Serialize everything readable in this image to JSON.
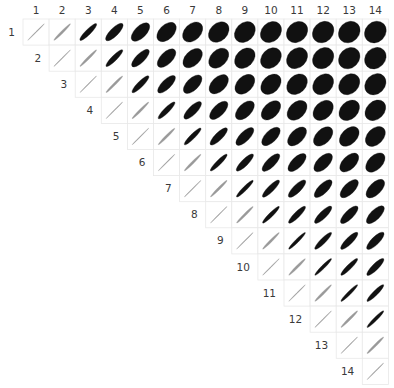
{
  "figure": {
    "title": "",
    "background_color": "#ffffff",
    "ellipse_color": "#111111",
    "faint_ellipse_color": "#9a9a9a",
    "cell_border_color": "#e8e8e8",
    "label_color": "#3a3a3a"
  },
  "axes": {
    "top_labels": [
      "1",
      "2",
      "3",
      "4",
      "5",
      "6",
      "7",
      "8",
      "9",
      "10",
      "11",
      "12",
      "13",
      "14"
    ],
    "diagonal_labels": [
      "1",
      "2",
      "3",
      "4",
      "5",
      "6",
      "7",
      "8",
      "9",
      "10",
      "11",
      "12",
      "13",
      "14"
    ]
  },
  "chart_data": {
    "type": "heatmap",
    "subtype": "correlation-ellipse-matrix",
    "title": "",
    "xlabel": "",
    "ylabel": "",
    "grid": true,
    "legend_position": "none",
    "n_variables": 14,
    "triangle": "upper",
    "diagonal_shown": true,
    "value_range": [
      0,
      1
    ],
    "encoding": "Ellipse eccentricity encodes correlation: a thin 45-degree line is r = 1, a wide round ellipse is r near 0. All ellipses tilt positively (all correlations positive).",
    "categories": [
      "1",
      "2",
      "3",
      "4",
      "5",
      "6",
      "7",
      "8",
      "9",
      "10",
      "11",
      "12",
      "13",
      "14"
    ],
    "matrix": [
      [
        1.0,
        0.99,
        0.95,
        0.88,
        0.75,
        0.62,
        0.52,
        0.45,
        0.4,
        0.36,
        0.33,
        0.3,
        0.28,
        0.26
      ],
      [
        null,
        1.0,
        0.99,
        0.95,
        0.86,
        0.74,
        0.62,
        0.53,
        0.46,
        0.41,
        0.37,
        0.33,
        0.31,
        0.29
      ],
      [
        null,
        null,
        1.0,
        0.99,
        0.94,
        0.85,
        0.74,
        0.64,
        0.56,
        0.49,
        0.44,
        0.4,
        0.37,
        0.34
      ],
      [
        null,
        null,
        null,
        1.0,
        0.99,
        0.95,
        0.87,
        0.78,
        0.69,
        0.62,
        0.55,
        0.5,
        0.46,
        0.43
      ],
      [
        null,
        null,
        null,
        null,
        1.0,
        0.99,
        0.96,
        0.9,
        0.83,
        0.76,
        0.69,
        0.63,
        0.58,
        0.54
      ],
      [
        null,
        null,
        null,
        null,
        null,
        1.0,
        0.99,
        0.96,
        0.92,
        0.86,
        0.8,
        0.74,
        0.69,
        0.64
      ],
      [
        null,
        null,
        null,
        null,
        null,
        null,
        1.0,
        0.99,
        0.97,
        0.93,
        0.89,
        0.84,
        0.79,
        0.74
      ],
      [
        null,
        null,
        null,
        null,
        null,
        null,
        null,
        1.0,
        0.99,
        0.97,
        0.94,
        0.91,
        0.87,
        0.83
      ],
      [
        null,
        null,
        null,
        null,
        null,
        null,
        null,
        null,
        1.0,
        0.99,
        0.98,
        0.95,
        0.92,
        0.89
      ],
      [
        null,
        null,
        null,
        null,
        null,
        null,
        null,
        null,
        null,
        1.0,
        0.99,
        0.98,
        0.96,
        0.93
      ],
      [
        null,
        null,
        null,
        null,
        null,
        null,
        null,
        null,
        null,
        null,
        1.0,
        0.99,
        0.98,
        0.96
      ],
      [
        null,
        null,
        null,
        null,
        null,
        null,
        null,
        null,
        null,
        null,
        null,
        1.0,
        0.99,
        0.98
      ],
      [
        null,
        null,
        null,
        null,
        null,
        null,
        null,
        null,
        null,
        null,
        null,
        null,
        1.0,
        0.99
      ],
      [
        null,
        null,
        null,
        null,
        null,
        null,
        null,
        null,
        null,
        null,
        null,
        null,
        null,
        1.0
      ]
    ]
  },
  "layout": {
    "grid_origin_x": 23,
    "grid_origin_y": 19,
    "cell_size": 26.1,
    "top_label_y": 14,
    "left_label_offset_x": 8
  }
}
